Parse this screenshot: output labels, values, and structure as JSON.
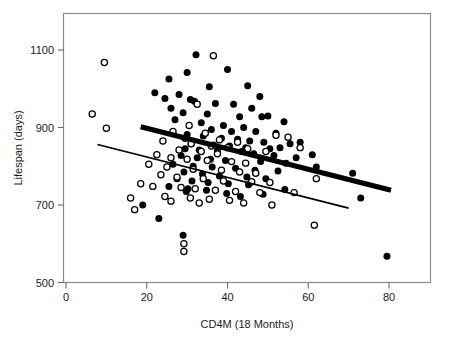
{
  "chart_data": {
    "type": "scatter",
    "title": "",
    "xlabel": "CD4M (18 Months)",
    "ylabel": "Lifespan (days)",
    "xlim": [
      0,
      90
    ],
    "ylim": [
      500,
      1140
    ],
    "xticks": [
      0,
      20,
      40,
      60,
      80
    ],
    "yticks": [
      500,
      700,
      900,
      1100
    ],
    "grid": false,
    "legend": "none",
    "series": [
      {
        "name": "filled-circles",
        "marker": "filled-circle",
        "color": "#000000",
        "points": [
          [
            32.2,
            1088
          ],
          [
            30.0,
            1042
          ],
          [
            40.0,
            1050
          ],
          [
            25.5,
            1025
          ],
          [
            35.5,
            1005
          ],
          [
            45.0,
            1008
          ],
          [
            22.0,
            990
          ],
          [
            28.0,
            985
          ],
          [
            48.0,
            980
          ],
          [
            24.5,
            975
          ],
          [
            30.8,
            972
          ],
          [
            31.8,
            968
          ],
          [
            37.0,
            962
          ],
          [
            41.5,
            960
          ],
          [
            46.0,
            950
          ],
          [
            26.0,
            950
          ],
          [
            29.0,
            938
          ],
          [
            35.0,
            935
          ],
          [
            43.0,
            928
          ],
          [
            48.5,
            928
          ],
          [
            50.0,
            930
          ],
          [
            54.0,
            915
          ],
          [
            27.0,
            920
          ],
          [
            33.5,
            912
          ],
          [
            39.0,
            905
          ],
          [
            44.0,
            900
          ],
          [
            36.0,
            895
          ],
          [
            41.0,
            890
          ],
          [
            47.0,
            890
          ],
          [
            52.0,
            885
          ],
          [
            30.0,
            882
          ],
          [
            34.0,
            878
          ],
          [
            38.5,
            872
          ],
          [
            42.5,
            870
          ],
          [
            45.5,
            865
          ],
          [
            49.0,
            862
          ],
          [
            55.5,
            858
          ],
          [
            58.0,
            862
          ],
          [
            31.0,
            858
          ],
          [
            36.5,
            855
          ],
          [
            40.5,
            852
          ],
          [
            44.5,
            848
          ],
          [
            50.5,
            845
          ],
          [
            53.0,
            848
          ],
          [
            29.5,
            845
          ],
          [
            33.0,
            842
          ],
          [
            37.5,
            840
          ],
          [
            43.5,
            838
          ],
          [
            46.5,
            832
          ],
          [
            51.5,
            828
          ],
          [
            57.0,
            822
          ],
          [
            61.0,
            830
          ],
          [
            28.5,
            828
          ],
          [
            32.5,
            822
          ],
          [
            35.8,
            818
          ],
          [
            39.5,
            815
          ],
          [
            48.2,
            812
          ],
          [
            54.5,
            808
          ],
          [
            26.5,
            805
          ],
          [
            31.5,
            800
          ],
          [
            36.2,
            798
          ],
          [
            42.0,
            795
          ],
          [
            46.8,
            790
          ],
          [
            52.5,
            788
          ],
          [
            62.0,
            798
          ],
          [
            29.2,
            785
          ],
          [
            33.8,
            780
          ],
          [
            38.0,
            775
          ],
          [
            44.8,
            772
          ],
          [
            49.5,
            768
          ],
          [
            71.0,
            782
          ],
          [
            27.5,
            768
          ],
          [
            31.2,
            762
          ],
          [
            35.2,
            758
          ],
          [
            40.2,
            755
          ],
          [
            45.2,
            752
          ],
          [
            25.5,
            748
          ],
          [
            30.2,
            742
          ],
          [
            34.8,
            738
          ],
          [
            54.2,
            740
          ],
          [
            19.0,
            700
          ],
          [
            29.8,
            735
          ],
          [
            39.8,
            730
          ],
          [
            48.8,
            728
          ],
          [
            43.2,
            722
          ],
          [
            23.0,
            665
          ],
          [
            73.0,
            718
          ],
          [
            29.0,
            622
          ],
          [
            79.5,
            568
          ]
        ]
      },
      {
        "name": "open-circles",
        "marker": "open-circle",
        "color": "#ffffff",
        "points": [
          [
            9.5,
            1068
          ],
          [
            36.5,
            1085
          ],
          [
            6.5,
            935
          ],
          [
            32.5,
            960
          ],
          [
            10.0,
            898
          ],
          [
            30.5,
            905
          ],
          [
            26.5,
            890
          ],
          [
            34.5,
            885
          ],
          [
            29.5,
            872
          ],
          [
            38.0,
            868
          ],
          [
            42.5,
            862
          ],
          [
            52.0,
            880
          ],
          [
            55.0,
            875
          ],
          [
            24.0,
            865
          ],
          [
            31.0,
            858
          ],
          [
            36.0,
            852
          ],
          [
            40.0,
            848
          ],
          [
            45.0,
            845
          ],
          [
            28.0,
            842
          ],
          [
            33.5,
            838
          ],
          [
            37.5,
            832
          ],
          [
            49.5,
            838
          ],
          [
            58.0,
            848
          ],
          [
            22.5,
            830
          ],
          [
            26.0,
            822
          ],
          [
            30.0,
            818
          ],
          [
            35.0,
            815
          ],
          [
            41.0,
            812
          ],
          [
            44.5,
            808
          ],
          [
            20.5,
            805
          ],
          [
            25.0,
            798
          ],
          [
            31.5,
            792
          ],
          [
            38.5,
            790
          ],
          [
            43.0,
            785
          ],
          [
            47.0,
            782
          ],
          [
            62.0,
            768
          ],
          [
            23.5,
            778
          ],
          [
            27.5,
            772
          ],
          [
            34.0,
            768
          ],
          [
            39.0,
            762
          ],
          [
            46.0,
            760
          ],
          [
            50.5,
            758
          ],
          [
            18.5,
            755
          ],
          [
            21.5,
            748
          ],
          [
            28.5,
            745
          ],
          [
            32.0,
            742
          ],
          [
            37.0,
            738
          ],
          [
            42.0,
            735
          ],
          [
            56.5,
            732
          ],
          [
            16.0,
            718
          ],
          [
            24.5,
            722
          ],
          [
            30.8,
            718
          ],
          [
            35.5,
            715
          ],
          [
            40.5,
            712
          ],
          [
            48.0,
            732
          ],
          [
            17.0,
            688
          ],
          [
            26.0,
            710
          ],
          [
            33.0,
            705
          ],
          [
            44.0,
            705
          ],
          [
            51.0,
            700
          ],
          [
            29.2,
            600
          ],
          [
            29.2,
            580
          ],
          [
            61.5,
            648
          ]
        ]
      }
    ],
    "fit_lines": [
      {
        "name": "thick-regression-line",
        "style": "thick",
        "x_start": 18.5,
        "y_start": 902,
        "x_end": 80.5,
        "y_end": 738
      },
      {
        "name": "thin-regression-line",
        "style": "thin",
        "x_start": 7.8,
        "y_start": 856,
        "x_end": 70.0,
        "y_end": 692
      }
    ]
  }
}
